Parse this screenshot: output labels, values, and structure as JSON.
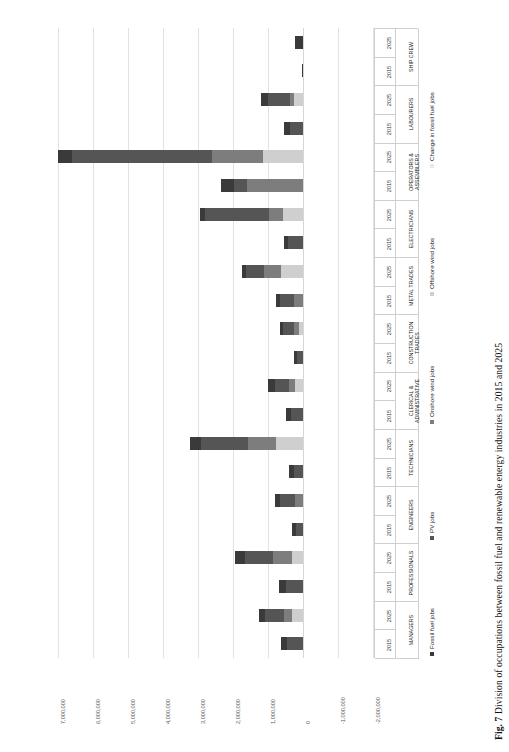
{
  "figure": {
    "number": "Fig. 7",
    "caption": "Division of occupations between fossil fuel and renewable energy industries in 2015 and 2025"
  },
  "chart_data": {
    "type": "bar",
    "orientation": "horizontal",
    "stacked": true,
    "title": "Division of occupations between fossil fuel and renewable energy industries in 2015 and 2025",
    "xlabel": "",
    "ylabel": "",
    "xlim": [
      -2000000,
      7000000
    ],
    "x_reversed": true,
    "grid": true,
    "legend_position": "right",
    "xticks": [
      7000000,
      6000000,
      5000000,
      4000000,
      3000000,
      2000000,
      1000000,
      0,
      -1000000,
      -2000000
    ],
    "xtick_labels": [
      "7,000,000",
      "6,000,000",
      "5,000,000",
      "4,000,000",
      "3,000,000",
      "2,000,000",
      "1,000,000",
      "0",
      "-1,000,000",
      "-2,000,000"
    ],
    "series": [
      {
        "name": "Fossil fuel jobs",
        "color": "#3a3a3a"
      },
      {
        "name": "PV jobs",
        "color": "#555555"
      },
      {
        "name": "Onshore wind jobs",
        "color": "#7d7d7d"
      },
      {
        "name": "Offshore wind jobs",
        "color": "#cfcfcf"
      },
      {
        "name": "Change in fossil fuel jobs",
        "color": "#e8e8e8"
      }
    ],
    "categories": [
      {
        "label": "SHIP CREW",
        "lines": [
          "SHIP CREW"
        ]
      },
      {
        "label": "LABOURERS",
        "lines": [
          "LABOURERS"
        ]
      },
      {
        "label": "OPERATORS & ASSEMBLERS",
        "lines": [
          "OPERATORS &",
          "ASSEMBLERS"
        ]
      },
      {
        "label": "ELECTRICIANS",
        "lines": [
          "ELECTRICIANS"
        ]
      },
      {
        "label": "METAL TRADES",
        "lines": [
          "METAL TRADES"
        ]
      },
      {
        "label": "CONSTRUCTION TRADES",
        "lines": [
          "CONSTRUCTION",
          "TRADES"
        ]
      },
      {
        "label": "CLERICAL & ADMINISTRATIVE",
        "lines": [
          "CLERICAL &",
          "ADMINISTRATIVE"
        ]
      },
      {
        "label": "TECHNICIANS",
        "lines": [
          "TECHNICIANS"
        ]
      },
      {
        "label": "ENGINEERS",
        "lines": [
          "ENGINEERS"
        ]
      },
      {
        "label": "PROFESSIONALS",
        "lines": [
          "PROFESSIONALS"
        ]
      },
      {
        "label": "MANAGERS",
        "lines": [
          "MANAGERS"
        ]
      }
    ],
    "years": [
      "2025",
      "2015"
    ],
    "rows": [
      {
        "category": "SHIP CREW",
        "year": "2025",
        "values": {
          "Fossil fuel jobs": 240000,
          "PV jobs": 0,
          "Onshore wind jobs": 0,
          "Offshore wind jobs": 0,
          "Change in fossil fuel jobs": 0
        }
      },
      {
        "category": "SHIP CREW",
        "year": "2015",
        "values": {
          "Fossil fuel jobs": 25000,
          "PV jobs": 0,
          "Onshore wind jobs": 0,
          "Offshore wind jobs": 0,
          "Change in fossil fuel jobs": 0
        }
      },
      {
        "category": "LABOURERS",
        "year": "2025",
        "values": {
          "Fossil fuel jobs": 210000,
          "PV jobs": 640000,
          "Onshore wind jobs": 110000,
          "Offshore wind jobs": 250000,
          "Change in fossil fuel jobs": 0
        }
      },
      {
        "category": "LABOURERS",
        "year": "2015",
        "values": {
          "Fossil fuel jobs": 180000,
          "PV jobs": 360000,
          "Onshore wind jobs": 0,
          "Offshore wind jobs": 0,
          "Change in fossil fuel jobs": 0
        }
      },
      {
        "category": "OPERATORS & ASSEMBLERS",
        "year": "2025",
        "values": {
          "Fossil fuel jobs": 400000,
          "PV jobs": 4000000,
          "Onshore wind jobs": 1450000,
          "Offshore wind jobs": 1150000,
          "Change in fossil fuel jobs": 0
        }
      },
      {
        "category": "OPERATORS & ASSEMBLERS",
        "year": "2015",
        "values": {
          "Fossil fuel jobs": 350000,
          "PV jobs": 380000,
          "Onshore wind jobs": 1600000,
          "Offshore wind jobs": 0,
          "Change in fossil fuel jobs": 0
        }
      },
      {
        "category": "ELECTRICIANS",
        "year": "2025",
        "values": {
          "Fossil fuel jobs": 130000,
          "PV jobs": 1850000,
          "Onshore wind jobs": 390000,
          "Offshore wind jobs": 570000,
          "Change in fossil fuel jobs": 0
        }
      },
      {
        "category": "ELECTRICIANS",
        "year": "2015",
        "values": {
          "Fossil fuel jobs": 120000,
          "PV jobs": 420000,
          "Onshore wind jobs": 0,
          "Offshore wind jobs": 0,
          "Change in fossil fuel jobs": 0
        }
      },
      {
        "category": "METAL TRADES",
        "year": "2025",
        "values": {
          "Fossil fuel jobs": 120000,
          "PV jobs": 520000,
          "Onshore wind jobs": 460000,
          "Offshore wind jobs": 640000,
          "Change in fossil fuel jobs": 0
        }
      },
      {
        "category": "METAL TRADES",
        "year": "2015",
        "values": {
          "Fossil fuel jobs": 110000,
          "PV jobs": 390000,
          "Onshore wind jobs": 260000,
          "Offshore wind jobs": 0,
          "Change in fossil fuel jobs": 0
        }
      },
      {
        "category": "CONSTRUCTION TRADES",
        "year": "2025",
        "values": {
          "Fossil fuel jobs": 90000,
          "PV jobs": 310000,
          "Onshore wind jobs": 140000,
          "Offshore wind jobs": 120000,
          "Change in fossil fuel jobs": 0
        }
      },
      {
        "category": "CONSTRUCTION TRADES",
        "year": "2015",
        "values": {
          "Fossil fuel jobs": 80000,
          "PV jobs": 180000,
          "Onshore wind jobs": 0,
          "Offshore wind jobs": 0,
          "Change in fossil fuel jobs": 0
        }
      },
      {
        "category": "CLERICAL & ADMINISTRATIVE",
        "year": "2025",
        "values": {
          "Fossil fuel jobs": 180000,
          "PV jobs": 420000,
          "Onshore wind jobs": 170000,
          "Offshore wind jobs": 220000,
          "Change in fossil fuel jobs": 0
        }
      },
      {
        "category": "CLERICAL & ADMINISTRATIVE",
        "year": "2015",
        "values": {
          "Fossil fuel jobs": 160000,
          "PV jobs": 330000,
          "Onshore wind jobs": 0,
          "Offshore wind jobs": 0,
          "Change in fossil fuel jobs": 0
        }
      },
      {
        "category": "TECHNICIANS",
        "year": "2025",
        "values": {
          "Fossil fuel jobs": 330000,
          "PV jobs": 1350000,
          "Onshore wind jobs": 780000,
          "Offshore wind jobs": 780000,
          "Change in fossil fuel jobs": 0
        }
      },
      {
        "category": "TECHNICIANS",
        "year": "2015",
        "values": {
          "Fossil fuel jobs": 140000,
          "PV jobs": 260000,
          "Onshore wind jobs": 0,
          "Offshore wind jobs": 0,
          "Change in fossil fuel jobs": 0
        }
      },
      {
        "category": "ENGINEERS",
        "year": "2025",
        "values": {
          "Fossil fuel jobs": 160000,
          "PV jobs": 420000,
          "Onshore wind jobs": 230000,
          "Offshore wind jobs": 0,
          "Change in fossil fuel jobs": 0
        }
      },
      {
        "category": "ENGINEERS",
        "year": "2015",
        "values": {
          "Fossil fuel jobs": 130000,
          "PV jobs": 190000,
          "Onshore wind jobs": 0,
          "Offshore wind jobs": 0,
          "Change in fossil fuel jobs": 0
        }
      },
      {
        "category": "PROFESSIONALS",
        "year": "2025",
        "values": {
          "Fossil fuel jobs": 280000,
          "PV jobs": 800000,
          "Onshore wind jobs": 540000,
          "Offshore wind jobs": 320000,
          "Change in fossil fuel jobs": 0
        }
      },
      {
        "category": "PROFESSIONALS",
        "year": "2015",
        "values": {
          "Fossil fuel jobs": 200000,
          "PV jobs": 480000,
          "Onshore wind jobs": 0,
          "Offshore wind jobs": 0,
          "Change in fossil fuel jobs": 0
        }
      },
      {
        "category": "MANAGERS",
        "year": "2025",
        "values": {
          "Fossil fuel jobs": 180000,
          "PV jobs": 540000,
          "Onshore wind jobs": 240000,
          "Offshore wind jobs": 310000,
          "Change in fossil fuel jobs": 0
        }
      },
      {
        "category": "MANAGERS",
        "year": "2015",
        "values": {
          "Fossil fuel jobs": 170000,
          "PV jobs": 470000,
          "Onshore wind jobs": 0,
          "Offshore wind jobs": 0,
          "Change in fossil fuel jobs": 0
        }
      }
    ]
  }
}
